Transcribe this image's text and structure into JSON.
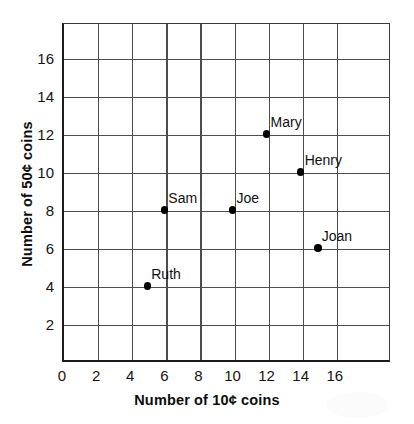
{
  "chart_data": {
    "type": "scatter",
    "title": "",
    "xlabel": "Number of 10¢ coins",
    "ylabel": "Number of 50¢ coins",
    "xlim": [
      0,
      18
    ],
    "ylim": [
      0,
      18
    ],
    "xticks": [
      "0",
      "2",
      "4",
      "6",
      "8",
      "10",
      "12",
      "14",
      "16"
    ],
    "xtick_values": [
      0,
      2,
      4,
      6,
      8,
      10,
      12,
      14,
      16
    ],
    "yticks": [
      "2",
      "4",
      "6",
      "8",
      "10",
      "12",
      "14",
      "16"
    ],
    "ytick_values": [
      2,
      4,
      6,
      8,
      10,
      12,
      14,
      16
    ],
    "grid": true,
    "legend": "none",
    "marker_color": "#000000",
    "grid_color": "#4d4d4d",
    "axis_color": "#1a1a1a",
    "points": [
      {
        "label": "Ruth",
        "x": 5,
        "y": 4
      },
      {
        "label": "Sam",
        "x": 6,
        "y": 8
      },
      {
        "label": "Joe",
        "x": 10,
        "y": 8
      },
      {
        "label": "Mary",
        "x": 12,
        "y": 12
      },
      {
        "label": "Henry",
        "x": 14,
        "y": 10
      },
      {
        "label": "Joan",
        "x": 15,
        "y": 6
      }
    ]
  }
}
